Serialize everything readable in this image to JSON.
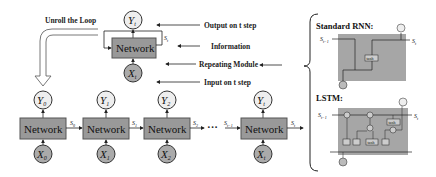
{
  "diagram": {
    "title_left": "Unroll the Loop",
    "folded": {
      "network_label": "Network",
      "output": "Y",
      "output_sub": "t",
      "input": "X",
      "input_sub": "t",
      "state": "S",
      "state_sub": "t"
    },
    "annotations": [
      {
        "id": "output",
        "text": "Output on t step"
      },
      {
        "id": "information",
        "text": "Information"
      },
      {
        "id": "repeating",
        "text": "Repeating Module"
      },
      {
        "id": "input",
        "text": "Input on t step"
      }
    ],
    "unrolled": [
      {
        "network": "Network",
        "y": "Y",
        "y_sub": "0",
        "x": "X",
        "x_sub": "0",
        "s_out": "S",
        "s_out_sub": "0"
      },
      {
        "network": "Network",
        "y": "Y",
        "y_sub": "1",
        "x": "X",
        "x_sub": "1",
        "s_out": "S",
        "s_out_sub": "1"
      },
      {
        "network": "Network",
        "y": "Y",
        "y_sub": "2",
        "x": "X",
        "x_sub": "2",
        "s_out": "S",
        "s_out_sub": "2"
      },
      {
        "network": "Network",
        "y": "Y",
        "y_sub": "t",
        "x": "X",
        "x_sub": "t",
        "s_in": "S",
        "s_in_sub": "t−1",
        "s_out": "S",
        "s_out_sub": "t"
      }
    ],
    "ellipsis": "···",
    "right_panel": {
      "rnn_title": "Standard RNN:",
      "lstm_title": "LSTM:",
      "s_in": "S",
      "s_in_sub": "t−1",
      "s_out": "S",
      "s_out_sub": "t",
      "tanh": "tanh",
      "sigma": "σ",
      "times": "×",
      "plus": "+"
    },
    "colors": {
      "network_fill": "#999999",
      "network_stroke": "#555555",
      "output_circle": "#eeeeee",
      "input_circle": "#aaaaaa",
      "panel_fill": "#a6a6a6"
    }
  }
}
